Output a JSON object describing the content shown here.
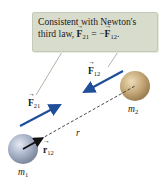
{
  "callout": {
    "line1": "Consistent with Newton's",
    "line2_prefix": "third law, ",
    "eq_lhs_vec": "F",
    "eq_lhs_sub": "21",
    "eq_mid": " = −",
    "eq_rhs_vec": "F",
    "eq_rhs_sub": "12",
    "eq_end": "."
  },
  "labels": {
    "F12": {
      "vec": "F",
      "sub": "12"
    },
    "F21": {
      "vec": "F",
      "sub": "21"
    },
    "r": "r",
    "r12": {
      "vec": "r",
      "sub": "12"
    },
    "m1": {
      "sym": "m",
      "sub": "1"
    },
    "m2": {
      "sym": "m",
      "sub": "2"
    }
  },
  "colors": {
    "force_arrow": "#1f4e9a",
    "unit_vector": "#111111",
    "sphere_m1": "#a9b3c8",
    "sphere_m2": "#c8ad7f",
    "callout_bg": "#d8dccd"
  }
}
